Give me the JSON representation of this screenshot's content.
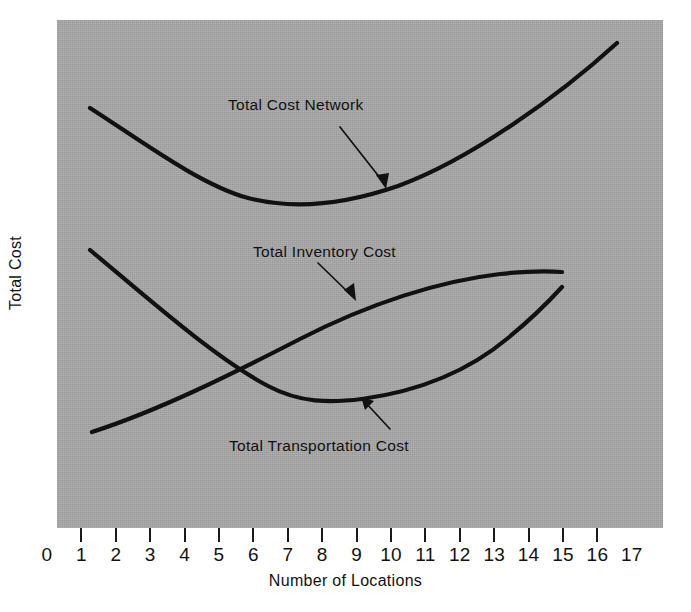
{
  "chart_data": {
    "type": "line",
    "title": "",
    "subtitle": "",
    "xlabel": "Number of Locations",
    "ylabel": "Total Cost",
    "xticklabels": [
      "0",
      "1",
      "2",
      "3",
      "4",
      "5",
      "6",
      "7",
      "8",
      "9",
      "10",
      "11",
      "12",
      "13",
      "14",
      "15",
      "16",
      "17"
    ],
    "xlim": [
      0,
      17
    ],
    "ylim": [
      0,
      1
    ],
    "yticklabels": [],
    "grid": false,
    "legend_position": "inline-annotations",
    "background_color": "#a8a8a8",
    "line_color": "#111111",
    "annotations": [
      {
        "name": "total-cost-network-label",
        "text": "Total Cost Network",
        "arrow": "points down-right to the total cost network curve"
      },
      {
        "name": "total-inventory-cost-label",
        "text": "Total Inventory Cost",
        "arrow": "points down-right to the total inventory cost curve"
      },
      {
        "name": "total-transportation-cost-label",
        "text": "Total Transportation Cost",
        "arrow": "points up-left to the total transportation cost curve minimum"
      }
    ],
    "series": [
      {
        "name": "Total Cost Network",
        "description": "U-shaped total cost curve; high at 1 location, minimum near 6-7 locations, rising steeply to 16 locations",
        "x": [
          1,
          2,
          3,
          4,
          5,
          6,
          7,
          8,
          9,
          10,
          11,
          12,
          13,
          14,
          15,
          16
        ],
        "y_relative": [
          0.79,
          0.72,
          0.66,
          0.62,
          0.6,
          0.595,
          0.6,
          0.615,
          0.645,
          0.685,
          0.735,
          0.79,
          0.845,
          0.9,
          0.945,
          0.97
        ]
      },
      {
        "name": "Total Inventory Cost",
        "description": "Monotonically increasing, concave-down curve rising from 1 location and flattening near 14 locations",
        "x": [
          1,
          2,
          3,
          4,
          5,
          6,
          7,
          8,
          9,
          10,
          11,
          12,
          13,
          14
        ],
        "y_relative": [
          0.19,
          0.235,
          0.285,
          0.335,
          0.39,
          0.44,
          0.485,
          0.525,
          0.555,
          0.575,
          0.59,
          0.6,
          0.605,
          0.61
        ]
      },
      {
        "name": "Total Transportation Cost",
        "description": "Decreasing then increasing curve; falls from 1 location to a minimum near 8 locations, then rises to 14 locations",
        "x": [
          1,
          2,
          3,
          4,
          5,
          6,
          7,
          8,
          9,
          10,
          11,
          12,
          13,
          14
        ],
        "y_relative": [
          0.555,
          0.49,
          0.435,
          0.385,
          0.345,
          0.315,
          0.3,
          0.295,
          0.305,
          0.33,
          0.375,
          0.435,
          0.505,
          0.585
        ]
      }
    ]
  },
  "figure": {
    "xlabel": "Number of Locations",
    "ylabel": "Total Cost",
    "ticks": [
      "0",
      "1",
      "2",
      "3",
      "4",
      "5",
      "6",
      "7",
      "8",
      "9",
      "10",
      "11",
      "12",
      "13",
      "14",
      "15",
      "16",
      "17"
    ],
    "labels": {
      "network": "Total Cost Network",
      "inventory": "Total Inventory Cost",
      "transportation": "Total Transportation Cost"
    }
  }
}
